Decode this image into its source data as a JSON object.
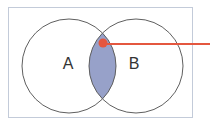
{
  "diagram": {
    "type": "venn-diagram",
    "set_a_label": "A",
    "set_b_label": "B",
    "highlighted_region": "intersection of A and B",
    "colors": {
      "background": "#ffffff",
      "frame_border": "#c3cbd9",
      "frame_fill": "#ffffff",
      "circle_stroke": "#5f5f5f",
      "circle_fill": "none",
      "intersection_fill": "#97a1c9",
      "pointer_color": "#e4573f",
      "label_color": "#333333"
    }
  }
}
